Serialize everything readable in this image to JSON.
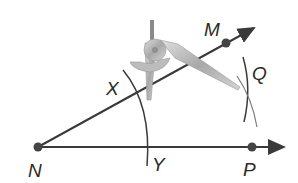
{
  "diagram": {
    "type": "geometry-compass-construction",
    "points": {
      "N": {
        "label": "N",
        "x": 38,
        "y": 147
      },
      "P": {
        "label": "P",
        "x": 252,
        "y": 147
      },
      "M": {
        "label": "M",
        "x": 226,
        "y": 43
      },
      "X": {
        "label": "X"
      },
      "Y": {
        "label": "Y"
      },
      "Q": {
        "label": "Q"
      }
    },
    "rays": [
      {
        "name": "ray-NP",
        "from": "N",
        "through": "P"
      },
      {
        "name": "ray-NM",
        "from": "N",
        "through": "M"
      }
    ],
    "colors": {
      "line": "#3a3a3a",
      "point": "#444444",
      "arc": "#3a3a3a",
      "compass": "#b8b8b8"
    }
  }
}
